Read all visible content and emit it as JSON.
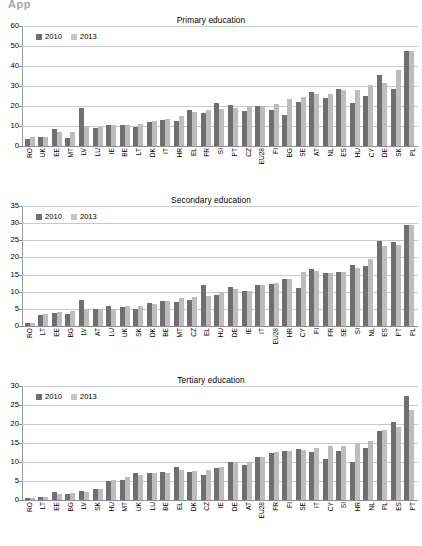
{
  "document": {
    "top_fragment": "App"
  },
  "legend": {
    "series": [
      {
        "label": "2010",
        "color": "#6f6f6f"
      },
      {
        "label": "2013",
        "color": "#c6c6c6"
      }
    ]
  },
  "chart_data": [
    {
      "type": "bar",
      "title": "Primary education",
      "xlabel": "",
      "ylabel": "",
      "ylim": [
        0,
        60
      ],
      "yticks": [
        0,
        10,
        20,
        30,
        40,
        50,
        60
      ],
      "grid": true,
      "legend_position": "top-left",
      "categories": [
        "RO",
        "UK",
        "EE",
        "MT",
        "LV",
        "LU",
        "IE",
        "BE",
        "LT",
        "DK",
        "IT",
        "HR",
        "EL",
        "FR",
        "SI",
        "PT",
        "CZ",
        "EU28",
        "FI",
        "BG",
        "SE",
        "AT",
        "NL",
        "ES",
        "HU",
        "CY",
        "DE",
        "SK",
        "PL"
      ],
      "series": [
        {
          "name": "2010",
          "color": "#6f6f6f",
          "values": [
            3.5,
            4.3,
            8.6,
            4.1,
            19.0,
            9.1,
            10.5,
            10.6,
            9.3,
            11.9,
            13.2,
            12.5,
            18.1,
            16.3,
            21.5,
            20.4,
            17.3,
            19.9,
            18.0,
            15.6,
            21.8,
            26.9,
            24.2,
            28.3,
            21.4,
            25.0,
            35.3,
            28.6,
            47.7
          ]
        },
        {
          "name": "2013",
          "color": "#c6c6c6",
          "values": [
            4.5,
            4.6,
            7.0,
            7.0,
            10.2,
            9.5,
            10.5,
            10.6,
            11.0,
            12.6,
            13.4,
            15.2,
            17.2,
            17.9,
            18.6,
            19.0,
            19.8,
            20.0,
            21.1,
            23.4,
            24.7,
            26.2,
            26.0,
            28.0,
            27.8,
            30.7,
            31.7,
            38.1,
            47.7
          ]
        }
      ]
    },
    {
      "type": "bar",
      "title": "Secondary education",
      "xlabel": "",
      "ylabel": "",
      "ylim": [
        0,
        35
      ],
      "yticks": [
        0,
        5,
        10,
        15,
        20,
        25,
        30,
        35
      ],
      "grid": true,
      "legend_position": "top-left",
      "categories": [
        "RO",
        "LT",
        "EE",
        "BG",
        "LV",
        "AT",
        "LU",
        "UK",
        "SK",
        "DK",
        "BE",
        "MT",
        "CZ",
        "EL",
        "HU",
        "DE",
        "IE",
        "IT",
        "EU28",
        "HR",
        "CY",
        "FI",
        "FR",
        "SE",
        "SI",
        "NL",
        "ES",
        "PT",
        "PL"
      ],
      "series": [
        {
          "name": "2010",
          "color": "#6f6f6f",
          "values": [
            0.8,
            3.2,
            3.9,
            3.4,
            7.6,
            5.0,
            5.8,
            5.5,
            4.9,
            6.7,
            7.2,
            7.1,
            7.7,
            12.1,
            9.1,
            11.4,
            10.1,
            11.9,
            12.4,
            13.7,
            11.2,
            16.6,
            15.6,
            15.7,
            17.9,
            17.4,
            24.9,
            24.4,
            29.5
          ]
        },
        {
          "name": "2013",
          "color": "#c6c6c6",
          "values": [
            1.0,
            3.5,
            4.1,
            4.3,
            5.0,
            4.9,
            5.1,
            5.7,
            5.9,
            6.4,
            7.2,
            8.2,
            8.6,
            8.9,
            9.8,
            10.7,
            10.2,
            11.9,
            12.6,
            13.7,
            15.8,
            16.0,
            15.6,
            15.8,
            16.8,
            19.5,
            23.3,
            23.7,
            29.5
          ]
        }
      ]
    },
    {
      "type": "bar",
      "title": "Tertiary education",
      "xlabel": "",
      "ylabel": "",
      "ylim": [
        0,
        30
      ],
      "yticks": [
        0,
        5,
        10,
        15,
        20,
        25,
        30
      ],
      "grid": true,
      "legend_position": "top-left",
      "categories": [
        "RO",
        "LT",
        "EE",
        "BG",
        "LV",
        "SK",
        "HU",
        "MT",
        "UK",
        "LU",
        "BE",
        "EL",
        "DK",
        "CZ",
        "IE",
        "DE",
        "AT",
        "EU28",
        "FR",
        "FI",
        "SE",
        "IT",
        "CY",
        "SI",
        "HR",
        "NL",
        "PL",
        "ES",
        "PT"
      ],
      "series": [
        {
          "name": "2010",
          "color": "#6f6f6f",
          "values": [
            0.4,
            0.9,
            2.0,
            1.5,
            2.3,
            2.9,
            5.0,
            5.2,
            7.0,
            7.2,
            7.5,
            8.8,
            7.4,
            6.7,
            8.3,
            10.0,
            9.2,
            11.3,
            12.5,
            12.9,
            13.3,
            12.6,
            10.9,
            12.9,
            9.9,
            13.8,
            18.1,
            20.5,
            27.3
          ]
        },
        {
          "name": "2013",
          "color": "#c6c6c6",
          "values": [
            0.5,
            0.8,
            1.6,
            1.8,
            2.0,
            3.0,
            5.3,
            6.1,
            6.7,
            7.2,
            7.1,
            7.9,
            7.6,
            8.0,
            8.6,
            10.0,
            9.9,
            11.3,
            12.6,
            12.9,
            13.2,
            13.8,
            14.2,
            14.3,
            15.1,
            15.5,
            18.3,
            19.2,
            23.6
          ]
        }
      ]
    }
  ]
}
